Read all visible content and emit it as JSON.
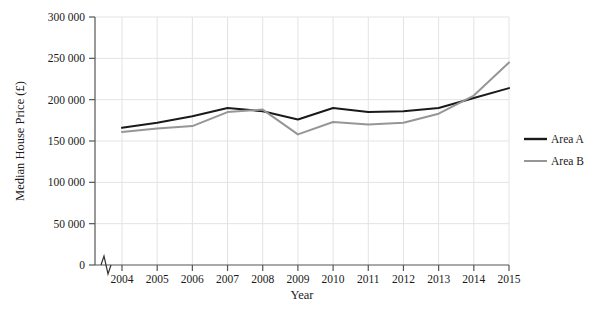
{
  "chart_data": {
    "type": "line",
    "title": "",
    "xlabel": "Year",
    "ylabel": "Median House Price (£)",
    "x": [
      2004,
      2005,
      2006,
      2007,
      2008,
      2009,
      2010,
      2011,
      2012,
      2013,
      2014,
      2015
    ],
    "xtick_labels": [
      "2004",
      "2005",
      "2006",
      "2007",
      "2008",
      "2009",
      "2010",
      "2011",
      "2012",
      "2013",
      "2014",
      "2015"
    ],
    "ytick_labels": [
      "0",
      "50 000",
      "100 000",
      "150 000",
      "200 000",
      "250 000",
      "300 000"
    ],
    "ytick_values": [
      0,
      50000,
      100000,
      150000,
      200000,
      250000,
      300000
    ],
    "ylim": [
      0,
      300000
    ],
    "xlim": [
      2004,
      2015
    ],
    "grid": true,
    "axis_break": true,
    "legend_position": "right",
    "series": [
      {
        "name": "Area A",
        "color": "#1a1a1a",
        "values": [
          166000,
          172000,
          180000,
          190000,
          186000,
          176000,
          190000,
          185000,
          186000,
          190000,
          202000,
          214000
        ]
      },
      {
        "name": "Area B",
        "color": "#969696",
        "values": [
          161000,
          165000,
          168000,
          185000,
          188000,
          158000,
          173000,
          170000,
          172000,
          183000,
          205000,
          245000
        ]
      }
    ]
  },
  "legend": {
    "items": [
      {
        "label": "Area A"
      },
      {
        "label": "Area B"
      }
    ]
  },
  "axes": {
    "x_title": "Year",
    "y_title": "Median House Price (£)"
  }
}
